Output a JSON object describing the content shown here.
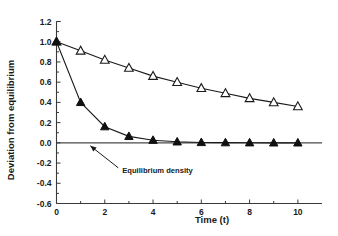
{
  "chart_data": {
    "type": "line",
    "title": "",
    "xlabel": "Time  (t)",
    "ylabel": "Deviation from equilibrium",
    "x": [
      0,
      1,
      2,
      3,
      4,
      5,
      6,
      7,
      8,
      9,
      10
    ],
    "xlim": [
      0,
      11
    ],
    "ylim": [
      -0.6,
      1.2
    ],
    "grid": false,
    "legend": "none",
    "xticks": [
      0,
      2,
      4,
      6,
      8,
      10
    ],
    "xtick_labels": [
      "0",
      "2",
      "4",
      "6",
      "8",
      "10"
    ],
    "x_minor_ticks": [
      1,
      3,
      5,
      7,
      9
    ],
    "yticks": [
      1.2,
      1.0,
      0.8,
      0.6,
      0.4,
      0.2,
      0.0,
      -0.2,
      -0.4,
      -0.6
    ],
    "ytick_labels": [
      "1.2",
      "1.0",
      "0.8",
      "0.6",
      "0.4",
      "0.2",
      "0.0",
      "-0.2",
      "-0.4",
      "-0.6"
    ],
    "series": [
      {
        "name": "slow-decay-open-triangle",
        "marker": "open-triangle",
        "values": [
          1.0,
          0.91,
          0.82,
          0.74,
          0.66,
          0.6,
          0.54,
          0.49,
          0.44,
          0.4,
          0.36
        ]
      },
      {
        "name": "fast-decay-filled-triangle",
        "marker": "filled-triangle",
        "values": [
          1.0,
          0.4,
          0.16,
          0.064,
          0.026,
          0.01,
          0.004,
          0.002,
          0.001,
          0.0,
          0.0
        ]
      }
    ],
    "annotations": [
      {
        "name": "equilibrium-density",
        "text": "Equilibrium  density",
        "points_to_x": 1.4,
        "points_to_y": 0.0
      }
    ],
    "reference_lines": [
      {
        "name": "zero-line",
        "y": 0.0
      }
    ],
    "colors": {
      "axis": "#3a3a3a",
      "line": "#1a1a1a",
      "marker_fill_open": "#ffffff",
      "marker_fill_solid": "#101010",
      "background": "#ffffff"
    }
  }
}
